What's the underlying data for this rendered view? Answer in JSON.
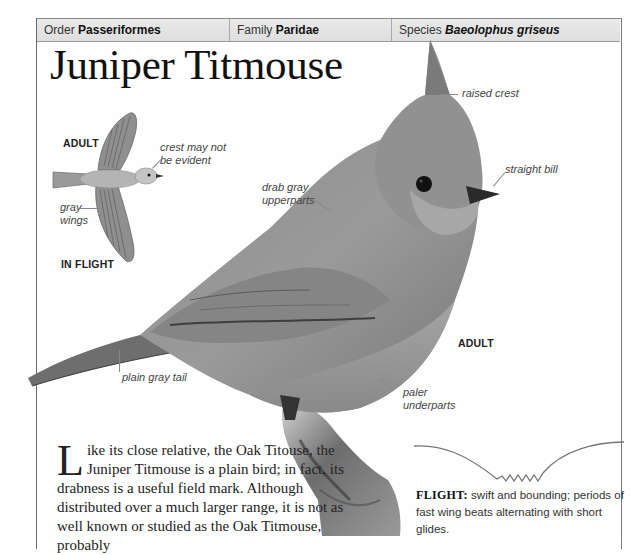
{
  "header": {
    "order_label": "Order",
    "order_value": "Passeriformes",
    "family_label": "Family",
    "family_value": "Paridae",
    "species_label": "Species",
    "species_value": "Baeolophus griseus"
  },
  "title": "Juniper Titmouse",
  "in_flight": {
    "adult_label": "ADULT",
    "in_flight_label": "IN FLIGHT",
    "annotations": [
      {
        "text_line1": "crest may not",
        "text_line2": "be evident"
      },
      {
        "text_line1": "gray",
        "text_line2": "wings"
      }
    ]
  },
  "main_bird": {
    "adult_label": "ADULT",
    "annotations": {
      "raised_crest": "raised crest",
      "straight_bill": "straight bill",
      "upperparts_line1": "drab gray",
      "upperparts_line2": "upperparts",
      "tail": "plain gray tail",
      "underparts_line1": "paler",
      "underparts_line2": "underparts"
    }
  },
  "description": {
    "dropcap": "L",
    "text": "ike its close relative, the Oak Titouse, the Juniper Titmouse is a plain bird; in fact, its drabness is a useful field mark. Although distributed over a much larger range, it is not as well known or studied as the Oak Titmouse, probably"
  },
  "flight": {
    "label": "FLIGHT:",
    "text": "swift and bounding; periods of fast wing beats alternating with short glides."
  },
  "colors": {
    "header_bg": "#e4e4e4",
    "border": "#777777",
    "bird_gray": "#8a8a8a",
    "text": "#222222"
  }
}
